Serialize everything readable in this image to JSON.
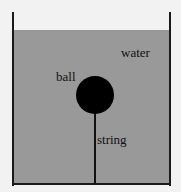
{
  "diagram": {
    "labels": {
      "water": "water",
      "ball": "ball",
      "string": "string"
    },
    "colors": {
      "water": "#999999",
      "ball": "#000000",
      "container": "#1a1a1a",
      "background": "#f2f2f2"
    }
  }
}
